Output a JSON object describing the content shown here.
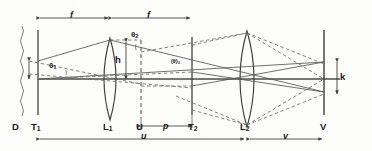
{
  "diagram": {
    "colors": {
      "stroke": "#3c3c3c",
      "ray_solid": "#555555",
      "ray_dashed": "#6b6b6b",
      "axis": "#4a4a4a",
      "text": "#1a1a1a",
      "background": "#fdfdfb"
    },
    "components": [
      {
        "id": "D",
        "label": "D",
        "kind": "wavy-source-line"
      },
      {
        "id": "T1",
        "label": "T",
        "sub": "1",
        "kind": "vertical-plane"
      },
      {
        "id": "L1",
        "label": "L",
        "sub": "1",
        "kind": "convex-lens"
      },
      {
        "id": "U",
        "label": "U",
        "kind": "dashed-vertical-plane"
      },
      {
        "id": "T2",
        "label": "T",
        "sub": "2",
        "kind": "vertical-plane"
      },
      {
        "id": "L2",
        "label": "L",
        "sub": "2",
        "kind": "convex-lens"
      },
      {
        "id": "V",
        "label": "V",
        "kind": "vertical-screen"
      }
    ],
    "dimensions": [
      {
        "id": "f-left",
        "label": "f",
        "position": "top",
        "from": "T1",
        "to": "L1"
      },
      {
        "id": "f-right",
        "label": "f",
        "position": "top",
        "from": "L1",
        "to": "U"
      },
      {
        "id": "p",
        "label": "p",
        "position": "bottom",
        "from": "U",
        "to": "T2"
      },
      {
        "id": "u",
        "label": "u",
        "position": "bottom",
        "from": "T1",
        "to": "L2"
      },
      {
        "id": "v",
        "label": "v",
        "position": "bottom",
        "from": "L2",
        "to": "V"
      }
    ],
    "measures": [
      {
        "id": "h",
        "label": "h",
        "description": "height from axis to lens L1 aperture top"
      },
      {
        "id": "k",
        "label": "k",
        "description": "image height on screen V"
      }
    ],
    "angles": [
      {
        "id": "theta-left",
        "label": "θ",
        "sub": "1",
        "description": "half angle at object T1"
      },
      {
        "id": "theta-upper",
        "label": "θ",
        "sub": "2",
        "description": "angle at plane U"
      },
      {
        "id": "theta-t2",
        "label": "(θ)",
        "sub": "3",
        "description": "angle at plane T2"
      }
    ]
  }
}
